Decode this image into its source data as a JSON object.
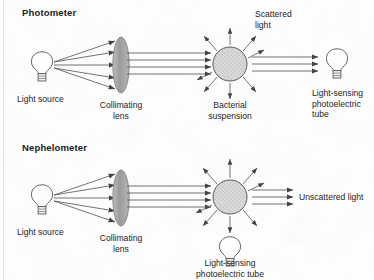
{
  "figure": {
    "title_photometer": "Photometer",
    "title_nephelometer": "Nephelometer",
    "background_color": "#fefefe",
    "stroke_color": "#4a4d50",
    "lens_fill": "#a9a9a9",
    "suspension_fill": "#d8d8d8"
  },
  "photometer": {
    "title": "Photometer",
    "label_light_source": "Light source",
    "label_collimating_lens": "Collimating\nlens",
    "label_suspension": "Bacterial\nsuspension",
    "label_scattered": "Scattered\nlight",
    "label_detector": "Light-sensing\nphotoelectric\ntube",
    "diverging_ray_count": 5,
    "collimated_ray_count": 4,
    "transmitted_ray_count": 3,
    "scatter_arrow_count": 8,
    "detector_position": "right"
  },
  "nephelometer": {
    "title": "Nephelometer",
    "label_light_source": "Light source",
    "label_collimating_lens": "Collimating\nlens",
    "label_unscattered": "Unscattered light",
    "label_detector": "Light-sensing\nphotoelectric tube",
    "diverging_ray_count": 5,
    "collimated_ray_count": 4,
    "transmitted_ray_count": 3,
    "scatter_arrow_count": 8,
    "detector_position": "below"
  },
  "icons": {
    "bulb": "light-bulb-icon",
    "lens": "collimating-lens-icon",
    "suspension": "bacterial-suspension-icon",
    "ray": "light-ray-arrow-icon"
  }
}
